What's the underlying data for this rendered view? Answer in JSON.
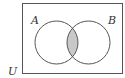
{
  "diagram": {
    "type": "venn",
    "universe": {
      "label": "U"
    },
    "sets": [
      {
        "label": "A"
      },
      {
        "label": "B"
      }
    ],
    "shaded_region": "A ∩ B",
    "colors": {
      "stroke": "#555555",
      "shade": "#c8c8c8",
      "background": "#ffffff"
    }
  }
}
